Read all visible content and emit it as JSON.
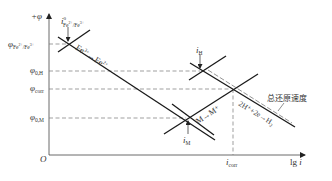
{
  "figure": {
    "type": "Evans polarization diagram",
    "axes": {
      "y_label": "+φ",
      "x_label": "lg i",
      "origin_label": "O"
    },
    "potential_levels": [
      {
        "id": "phi_fe",
        "symbol": "φ",
        "subscript": "Fe²⁺/Fe³⁺"
      },
      {
        "id": "phi_0H",
        "symbol": "φ",
        "subscript": "0,H"
      },
      {
        "id": "phi_corr",
        "symbol": "φ",
        "subscript": "corr"
      },
      {
        "id": "phi_0M",
        "symbol": "φ",
        "subscript": "0,M"
      }
    ],
    "current_labels": [
      {
        "id": "i0_fe",
        "symbol": "i",
        "superscript": "0",
        "subscript": "Fe²⁺/Fe³⁺"
      },
      {
        "id": "i_H",
        "symbol": "i",
        "subscript": "H"
      },
      {
        "id": "i_M",
        "symbol": "i",
        "subscript": "M"
      },
      {
        "id": "i_corr",
        "symbol": "i",
        "subscript": "corr"
      }
    ],
    "reactions": {
      "fe": {
        "base": "Fe",
        "sup1": "3+",
        "arrow": "→",
        "base2": "Fe",
        "sup2": "2+"
      },
      "metal": "M→M⁺",
      "hydrogen": {
        "lhs": "2H⁺+2e",
        "arrow": "→",
        "rhs": "H",
        "rhs_sub": "2"
      }
    },
    "annotation": "总还原速度",
    "colors": {
      "line": "#1a1a1a",
      "dash": "#777777",
      "text": "#333333"
    }
  }
}
